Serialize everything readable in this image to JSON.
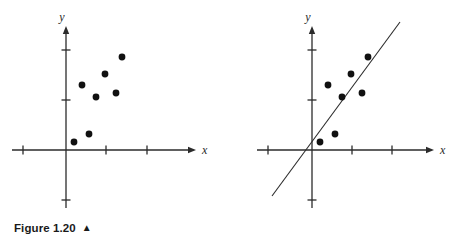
{
  "page": {
    "background_color": "#ffffff",
    "ink_color": "#2b2b2b",
    "point_color": "#111111"
  },
  "figures": [
    {
      "id": "figure-1-20",
      "caption_text": "Figure 1.20",
      "caption_marker": "▲",
      "axes": {
        "x_label": "x",
        "y_label": "y",
        "origin": {
          "x": 66,
          "y": 150
        },
        "x_axis": {
          "start_x": 12,
          "end_x": 196,
          "arrow": true
        },
        "y_axis": {
          "start_y": 208,
          "end_y": 26,
          "arrow": true
        },
        "x_ticks": [
          23,
          106,
          147
        ],
        "y_ticks": [
          50,
          100,
          200
        ],
        "tick_length": 9
      },
      "has_regression_line": false,
      "regression_line": null,
      "points": [
        {
          "x": 74,
          "y": 142
        },
        {
          "x": 89,
          "y": 134
        },
        {
          "x": 82,
          "y": 85
        },
        {
          "x": 96,
          "y": 97
        },
        {
          "x": 105,
          "y": 74
        },
        {
          "x": 116,
          "y": 93
        },
        {
          "x": 122,
          "y": 57
        }
      ],
      "point_radius": 3.4
    },
    {
      "id": "figure-1-21",
      "caption_text": "Figure 1.21",
      "caption_marker": "▲",
      "axes": {
        "x_label": "x",
        "y_label": "y",
        "origin": {
          "x": 83,
          "y": 150
        },
        "x_axis": {
          "start_x": 28,
          "end_x": 205,
          "arrow": true
        },
        "y_axis": {
          "start_y": 208,
          "end_y": 26,
          "arrow": true
        },
        "x_ticks": [
          39,
          123,
          163
        ],
        "y_ticks": [
          50,
          100,
          200
        ],
        "tick_length": 9
      },
      "has_regression_line": true,
      "regression_line": {
        "x1": 43,
        "y1": 196,
        "x2": 171,
        "y2": 22
      },
      "points": [
        {
          "x": 91,
          "y": 142
        },
        {
          "x": 106,
          "y": 134
        },
        {
          "x": 99,
          "y": 85
        },
        {
          "x": 113,
          "y": 97
        },
        {
          "x": 122,
          "y": 74
        },
        {
          "x": 133,
          "y": 93
        },
        {
          "x": 139,
          "y": 57
        }
      ],
      "point_radius": 3.4
    }
  ],
  "chart_data": {
    "type": "scatter",
    "title": "",
    "panels": [
      {
        "name": "Figure 1.20",
        "description": "Scatter plot of seven data points on x-y axes showing a positive association, no fitted line drawn.",
        "xlabel": "x",
        "ylabel": "y",
        "grid": false,
        "legend": "none",
        "axis_units": "unlabeled tick marks only",
        "xlim": [
          -1.3,
          3.2
        ],
        "ylim": [
          -1.2,
          3.0
        ],
        "points": [
          {
            "x": 0.2,
            "y": 0.2
          },
          {
            "x": 0.55,
            "y": 0.4
          },
          {
            "x": 0.39,
            "y": 1.55
          },
          {
            "x": 0.72,
            "y": 1.27
          },
          {
            "x": 0.94,
            "y": 1.81
          },
          {
            "x": 1.2,
            "y": 1.35
          },
          {
            "x": 1.34,
            "y": 2.2
          }
        ]
      },
      {
        "name": "Figure 1.21",
        "description": "Same seven data points with a least-squares regression line of positive slope drawn through them.",
        "xlabel": "x",
        "ylabel": "y",
        "grid": false,
        "legend": "none",
        "axis_units": "unlabeled tick marks only",
        "xlim": [
          -1.3,
          3.2
        ],
        "ylim": [
          -1.2,
          3.0
        ],
        "points": [
          {
            "x": 0.2,
            "y": 0.2
          },
          {
            "x": 0.55,
            "y": 0.4
          },
          {
            "x": 0.39,
            "y": 1.55
          },
          {
            "x": 0.72,
            "y": 1.27
          },
          {
            "x": 0.94,
            "y": 1.81
          },
          {
            "x": 1.2,
            "y": 1.35
          },
          {
            "x": 1.34,
            "y": 2.2
          }
        ],
        "fit_line": {
          "type": "linear",
          "from": {
            "x": -0.95,
            "y": -1.1
          },
          "to": {
            "x": 2.1,
            "y": 3.05
          }
        }
      }
    ]
  }
}
